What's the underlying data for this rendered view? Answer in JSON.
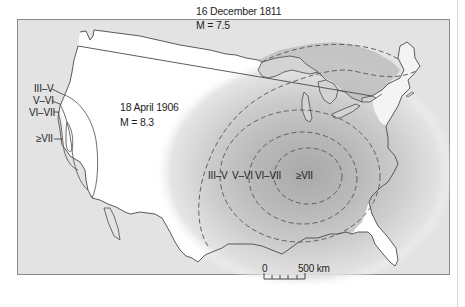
{
  "figure": {
    "colors": {
      "frame_fill": "#e3e3e3",
      "frame_border": "#8a8a8a",
      "land_fill": "#ffffff",
      "outline": "#4a4a4a",
      "zone_light": "#d6d6d6",
      "zone_mid": "#c4c4c4",
      "zone_dark": "#b2b2b2"
    }
  },
  "events": [
    {
      "id": "1906",
      "date": "18 April 1906",
      "magnitude": "M = 8.3",
      "intensity_labels": [
        "III–V",
        "V–VI",
        "VI–VII",
        "≥VII"
      ]
    },
    {
      "id": "1811",
      "date": "16 December 1811",
      "magnitude": "M = 7.5",
      "intensity_labels": [
        "III–V",
        "V–VI",
        "VI–VII",
        "≥VII"
      ]
    }
  ],
  "scale_bar": {
    "start_label": "0",
    "end_label": "500 km",
    "ticks": 6
  }
}
